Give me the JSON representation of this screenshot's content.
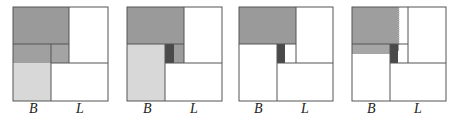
{
  "figure": {
    "panels": [
      {
        "id": 1,
        "labels": {
          "left": "B",
          "right": "L"
        }
      },
      {
        "id": 2,
        "labels": {
          "left": "B",
          "right": "L"
        }
      },
      {
        "id": 3,
        "labels": {
          "left": "B",
          "right": "L"
        }
      },
      {
        "id": 4,
        "labels": {
          "left": "B",
          "right": "L"
        }
      }
    ],
    "colors": {
      "dark_gray": "#9a9a9a",
      "mid_gray": "#a8a8a8",
      "light_gray": "#d8d8d8",
      "black_block": "#4a4a4a",
      "line": "#555555"
    }
  }
}
